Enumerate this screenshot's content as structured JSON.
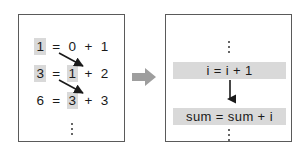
{
  "diagram": {
    "left_panel": {
      "name": "concrete-trace",
      "lines": [
        {
          "result": "1",
          "equals": "=",
          "left_operand": "0",
          "plus": "+",
          "right_operand": "1"
        },
        {
          "result": "3",
          "equals": "=",
          "left_operand": "1",
          "plus": "+",
          "right_operand": "2"
        },
        {
          "result": "6",
          "equals": "=",
          "left_operand": "3",
          "plus": "+",
          "right_operand": "3"
        }
      ],
      "continuation": "vertical-ellipsis"
    },
    "transform_arrow": {
      "name": "right-block-arrow",
      "direction": "right",
      "color": "#9e9e9e"
    },
    "right_panel": {
      "name": "generalized-statements",
      "top_continuation": "vertical-ellipsis",
      "statements": [
        {
          "text": "i = i + 1",
          "highlighted": true
        },
        {
          "text": "sum = sum + i",
          "highlighted": true
        }
      ],
      "flow_arrow": "down-arrow",
      "bottom_continuation": "vertical-ellipsis"
    },
    "colors": {
      "highlight": "#d9d9d9",
      "border": "#5a5a5a",
      "text": "#1a1a1a",
      "arrow": "#1a1a1a",
      "block_arrow": "#9e9e9e"
    }
  }
}
